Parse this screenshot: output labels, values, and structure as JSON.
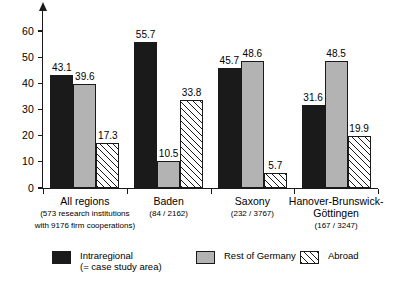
{
  "chart_data": {
    "type": "bar",
    "title": "",
    "subtitle": "",
    "xlabel": "",
    "ylabel": "",
    "ylim": [
      0,
      65
    ],
    "yticks": [
      0,
      10,
      20,
      30,
      40,
      50,
      60
    ],
    "ytick_labels": [
      "0",
      "10",
      "20",
      "30",
      "40",
      "50",
      "60"
    ],
    "grid": false,
    "legend_position": "bottom",
    "categories": [
      "All regions",
      "Baden",
      "Saxony",
      "Hanover-Brunswick-Göttingen"
    ],
    "category_sublabels": [
      [
        "(573 research institutions",
        "with 9176 firm cooperations)"
      ],
      [
        "(84 / 2162)"
      ],
      [
        "(232 / 3767)"
      ],
      [
        "(167 / 3247)"
      ]
    ],
    "series": [
      {
        "name": "Intraregional",
        "name_line2": "(= case study area)",
        "pattern": "solid-black",
        "color": "#1a1a1a",
        "values": [
          43.1,
          55.7,
          45.7,
          31.6
        ],
        "value_labels": [
          "43.1",
          "55.7",
          "45.7",
          "31.6"
        ]
      },
      {
        "name": "Rest of Germany",
        "name_line2": "",
        "pattern": "solid-grey",
        "color": "#b3b3b3",
        "values": [
          39.6,
          10.5,
          48.6,
          48.5
        ],
        "value_labels": [
          "39.6",
          "10.5",
          "48.6",
          "48.5"
        ]
      },
      {
        "name": "Abroad",
        "name_line2": "",
        "pattern": "diagonal-hatch",
        "color": "#ffffff",
        "values": [
          17.3,
          33.8,
          5.7,
          19.9
        ],
        "value_labels": [
          "17.3",
          "33.8",
          "5.7",
          "19.9"
        ]
      }
    ]
  },
  "legend": {
    "items": [
      {
        "label": "Intraregional",
        "label_line2": "(= case study area)",
        "pattern": "solid-black"
      },
      {
        "label": "Rest of Germany",
        "label_line2": "",
        "pattern": "solid-grey"
      },
      {
        "label": "Abroad",
        "label_line2": "",
        "pattern": "diagonal-hatch"
      }
    ]
  },
  "axis": {
    "y_tick_labels": [
      "0",
      "10",
      "20",
      "30",
      "40",
      "50",
      "60"
    ]
  }
}
